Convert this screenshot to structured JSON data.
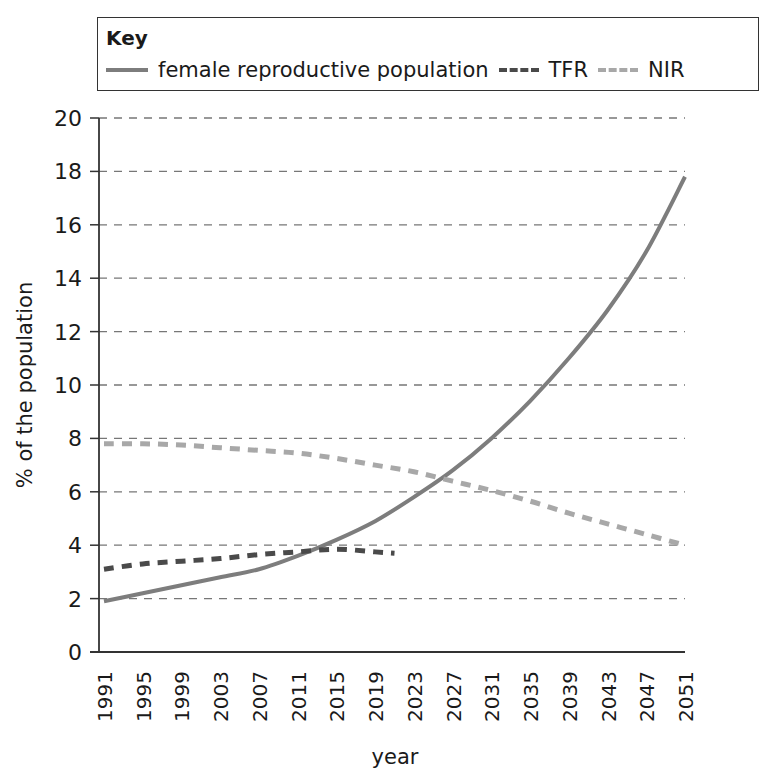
{
  "chart_data": {
    "type": "line",
    "title": "",
    "legend_title": "Key",
    "legend_position": "top",
    "xlabel": "year",
    "ylabel": "% of the population",
    "ylim": [
      0,
      20
    ],
    "xlim": [
      1991,
      2051
    ],
    "grid": "horizontal dashed",
    "yticks": [
      "0",
      "2",
      "4",
      "6",
      "8",
      "10",
      "12",
      "14",
      "16",
      "18",
      "20"
    ],
    "xticks": [
      "1991",
      "1995",
      "1999",
      "2003",
      "2007",
      "2011",
      "2015",
      "2019",
      "2023",
      "2027",
      "2031",
      "2035",
      "2039",
      "2043",
      "2047",
      "2051"
    ],
    "series": [
      {
        "name": "female reproductive population",
        "style": "solid",
        "color": "#7d7d7d",
        "x": [
          1991,
          1995,
          1999,
          2003,
          2007,
          2011,
          2015,
          2019,
          2023,
          2027,
          2031,
          2035,
          2039,
          2043,
          2047,
          2051
        ],
        "values": [
          1.9,
          2.2,
          2.5,
          2.8,
          3.1,
          3.6,
          4.2,
          4.9,
          5.8,
          6.8,
          8.0,
          9.4,
          11.0,
          12.8,
          15.0,
          17.8
        ]
      },
      {
        "name": "TFR",
        "style": "dashed",
        "color": "#4a4a4a",
        "x": [
          1991,
          1995,
          1999,
          2003,
          2007,
          2011,
          2015,
          2019,
          2021
        ],
        "values": [
          3.1,
          3.3,
          3.4,
          3.5,
          3.65,
          3.75,
          3.85,
          3.75,
          3.7
        ]
      },
      {
        "name": "NIR",
        "style": "dashed",
        "color": "#a8a8a8",
        "x": [
          1991,
          1995,
          1999,
          2003,
          2007,
          2011,
          2015,
          2019,
          2023,
          2027,
          2031,
          2035,
          2039,
          2043,
          2047,
          2051
        ],
        "values": [
          7.8,
          7.8,
          7.75,
          7.65,
          7.55,
          7.45,
          7.25,
          7.0,
          6.75,
          6.4,
          6.05,
          5.65,
          5.2,
          4.8,
          4.4,
          4.0
        ]
      }
    ]
  },
  "legend": {
    "title": "Key",
    "items": [
      "female reproductive population",
      "TFR",
      "NIR"
    ]
  },
  "axes": {
    "xlabel": "year",
    "ylabel": "% of the population"
  }
}
